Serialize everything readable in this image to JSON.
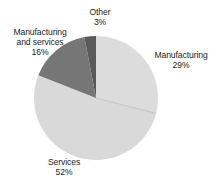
{
  "chart_data": {
    "type": "pie",
    "title": "",
    "categories": [
      "Manufacturing",
      "Services",
      "Manufacturing and services",
      "Other"
    ],
    "values": [
      29,
      52,
      16,
      3
    ],
    "value_suffix": "%",
    "legend": "none",
    "labels_position": "outside",
    "start_angle_deg": 0,
    "direction": "clockwise",
    "slices": [
      {
        "name": "Manufacturing",
        "value": 29,
        "value_text": "29%",
        "color": "#dcdcdc",
        "start_deg": 0,
        "end_deg": 104.4
      },
      {
        "name": "Services",
        "value": 52,
        "value_text": "52%",
        "color": "#d9d9d9",
        "start_deg": 104.4,
        "end_deg": 291.6
      },
      {
        "name": "Manufacturing and services",
        "value": 16,
        "value_text": "16%",
        "color": "#767676",
        "start_deg": 291.6,
        "end_deg": 349.2
      },
      {
        "name": "Other",
        "value": 3,
        "value_text": "3%",
        "color": "#5a5a5a",
        "start_deg": 349.2,
        "end_deg": 360
      }
    ]
  },
  "labels": {
    "other": {
      "name": "Other",
      "pct": "3%"
    },
    "manuserv": {
      "name_line1": "Manufacturing",
      "name_line2": "and services",
      "pct": "16%"
    },
    "manufacturing": {
      "name": "Manufacturing",
      "pct": "29%"
    },
    "services": {
      "name": "Services",
      "pct": "52%"
    }
  },
  "title_sliver": "",
  "colors": {
    "background": "#ffffff",
    "text": "#1d1d1d",
    "manufacturing": "#dcdcdc",
    "services": "#d9d9d9",
    "manufacturing_and_services": "#767676",
    "other": "#5a5a5a",
    "divider": "#c2c2c2"
  }
}
